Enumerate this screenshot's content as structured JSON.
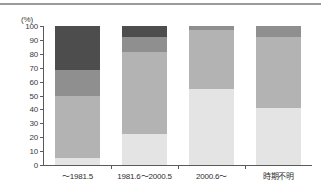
{
  "chart_data": {
    "type": "bar",
    "stacked": true,
    "title": "",
    "xlabel": "",
    "ylabel": "(%)",
    "ylim": [
      0,
      100
    ],
    "ytick_labels": [
      "0",
      "10",
      "20",
      "30",
      "40",
      "50",
      "60",
      "70",
      "80",
      "90",
      "100"
    ],
    "ytick_values": [
      0,
      10,
      20,
      30,
      40,
      50,
      60,
      70,
      80,
      90,
      100
    ],
    "grid": false,
    "legend": "none",
    "categories": [
      "～1981.5",
      "1981.6～2000.5",
      "2000.6～",
      "時期不明"
    ],
    "series": [
      {
        "name": "segment-1",
        "color": "#e4e4e4",
        "values": [
          5,
          22,
          55,
          41
        ]
      },
      {
        "name": "segment-2",
        "color": "#b3b3b3",
        "values": [
          45,
          59,
          42,
          51
        ]
      },
      {
        "name": "segment-3",
        "color": "#8f8f8f",
        "values": [
          18,
          11,
          3,
          8
        ]
      },
      {
        "name": "segment-4",
        "color": "#4d4d4d",
        "values": [
          32,
          8,
          0,
          0
        ]
      }
    ]
  },
  "axis": {
    "unit_label": "(%)"
  }
}
